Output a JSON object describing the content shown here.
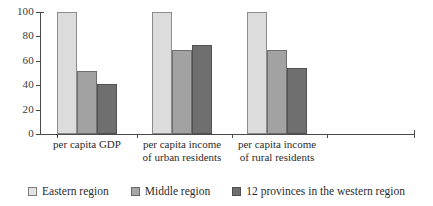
{
  "chart_data": {
    "type": "bar",
    "title": "",
    "subtitle": "",
    "xlabel": "",
    "ylabel": "",
    "ylim": [
      0,
      100
    ],
    "yticks": [
      0,
      20,
      40,
      60,
      80,
      100
    ],
    "grid": false,
    "legend_position": "bottom",
    "categories": [
      "per capita GDP",
      "per capita income\nof urban residents",
      "per capita income\nof rural residents"
    ],
    "series": [
      {
        "name": "Eastern region",
        "color": "#dcdcdc",
        "values": [
          100,
          100,
          100
        ]
      },
      {
        "name": "Middle region",
        "color": "#a2a2a2",
        "values": [
          52,
          69,
          69
        ]
      },
      {
        "name": "12 provinces in the western region",
        "color": "#6f6f6f",
        "values": [
          41,
          73,
          54
        ]
      }
    ]
  },
  "axis": {
    "y_tick_labels": [
      "100",
      "80",
      "60",
      "40",
      "20",
      "0"
    ]
  },
  "legend": {
    "items": [
      {
        "label": "Eastern region"
      },
      {
        "label": "Middle region"
      },
      {
        "label": "12 provinces in the western region"
      }
    ]
  }
}
